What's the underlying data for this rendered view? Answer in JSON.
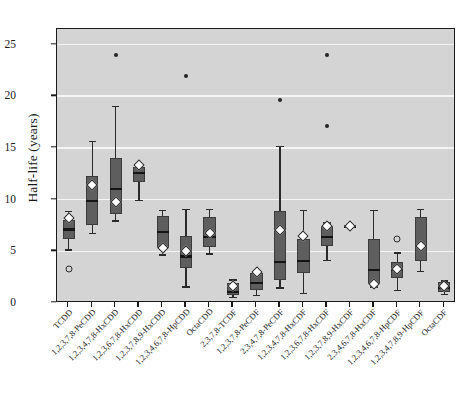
{
  "chart_data": {
    "type": "box",
    "title": "",
    "xlabel": "",
    "ylabel": "Half-life (years)",
    "ylim": [
      0,
      26.5
    ],
    "yticks": [
      0,
      5,
      10,
      15,
      20,
      25
    ],
    "grid": true,
    "legend": "none",
    "categories": [
      "TCDD",
      "1,2,3,7,8-PeCDD",
      "1,2,3,4,7,8-HxCDD",
      "1,2,3,6,7,8-HxCDD",
      "1,2,3,7,8,9-HxCDD",
      "1,2,3,4,6,7,8-HpCDD",
      "OctaCDD",
      "2,3,7,8-TCDF",
      "1,2,3,7,8-PeCDF",
      "2,3,4,7,8-PeCDF",
      "1,2,3,4,7,8-HxCDF",
      "1,2,3,6,7,8-HxCDF",
      "1,2,3,7,8,9-HxCDF",
      "2,3,4,6,7,8-HxCDF",
      "1,2,3,4,6,7,8-HpCDF",
      "1,2,3,4,7,8,9-HpCDF",
      "OctaCDF"
    ],
    "boxes": [
      {
        "category": "TCDD",
        "whisker_low": 5.2,
        "q1": 6.2,
        "median": 7.1,
        "q3": 8.0,
        "whisker_high": 8.9,
        "mean": 8.2,
        "outliers": [
          3.3
        ]
      },
      {
        "category": "1,2,3,7,8-PeCDD",
        "whisker_low": 6.8,
        "q1": 7.5,
        "median": 9.9,
        "q3": 12.3,
        "whisker_high": 15.7,
        "mean": 11.4,
        "outliers": []
      },
      {
        "category": "1,2,3,4,7,8-HxCDD",
        "whisker_low": 8.0,
        "q1": 8.6,
        "median": 11.0,
        "q3": 14.0,
        "whisker_high": 19.1,
        "mean": 9.8,
        "outliers": [
          24.0
        ]
      },
      {
        "category": "1,2,3,6,7,8-HxCDD",
        "whisker_low": 10.0,
        "q1": 11.7,
        "median": 12.6,
        "q3": 13.2,
        "whisker_high": 13.3,
        "mean": 13.3,
        "outliers": []
      },
      {
        "category": "1,2,3,7,8,9-HxCDD",
        "whisker_low": 4.7,
        "q1": 5.3,
        "median": 6.9,
        "q3": 8.4,
        "whisker_high": 9.0,
        "mean": 5.3,
        "outliers": []
      },
      {
        "category": "1,2,3,4,6,7,8-HpCDD",
        "whisker_low": 1.6,
        "q1": 3.4,
        "median": 4.5,
        "q3": 6.5,
        "whisker_high": 9.1,
        "mean": 5.0,
        "outliers": [
          22.0
        ]
      },
      {
        "category": "OctaCDD",
        "whisker_low": 4.8,
        "q1": 5.4,
        "median": 6.4,
        "q3": 8.3,
        "whisker_high": 9.1,
        "mean": 6.8,
        "outliers": []
      },
      {
        "category": "2,3,7,8-TCDF",
        "whisker_low": 0.6,
        "q1": 0.8,
        "median": 1.1,
        "q3": 1.9,
        "whisker_high": 2.3,
        "mean": 1.6,
        "outliers": []
      },
      {
        "category": "1,2,3,7,8-PeCDF",
        "whisker_low": 0.8,
        "q1": 1.3,
        "median": 1.9,
        "q3": 2.9,
        "whisker_high": 3.0,
        "mean": 3.0,
        "outliers": []
      },
      {
        "category": "2,3,4,7,8-PeCDF",
        "whisker_low": 1.5,
        "q1": 2.2,
        "median": 4.0,
        "q3": 8.9,
        "whisker_high": 15.2,
        "mean": 7.1,
        "outliers": [
          19.6
        ]
      },
      {
        "category": "1,2,3,4,7,8-HxCDF",
        "whisker_low": 1.0,
        "q1": 2.9,
        "median": 4.1,
        "q3": 6.2,
        "whisker_high": 9.0,
        "mean": 6.5,
        "outliers": []
      },
      {
        "category": "1,2,3,6,7,8-HxCDF",
        "whisker_low": 4.2,
        "q1": 5.5,
        "median": 6.4,
        "q3": 7.4,
        "whisker_high": 7.8,
        "mean": 7.4,
        "outliers": [
          24.0,
          17.1
        ]
      },
      {
        "category": "1,2,3,7,8,9-HxCDF",
        "whisker_low": 7.4,
        "q1": 7.4,
        "median": 7.4,
        "q3": 7.4,
        "whisker_high": 7.4,
        "mean": 7.4,
        "outliers": []
      },
      {
        "category": "2,3,4,6,7,8-HxCDF",
        "whisker_low": 1.6,
        "q1": 1.8,
        "median": 3.2,
        "q3": 6.2,
        "whisker_high": 9.0,
        "mean": 1.8,
        "outliers": []
      },
      {
        "category": "1,2,3,4,6,7,8-HpCDF",
        "whisker_low": 1.3,
        "q1": 2.4,
        "median": 3.2,
        "q3": 4.0,
        "whisker_high": 4.9,
        "mean": 3.3,
        "outliers": [
          6.2
        ]
      },
      {
        "category": "1,2,3,4,7,8,9-HpCDF",
        "whisker_low": 3.1,
        "q1": 4.1,
        "median": 5.5,
        "q3": 8.3,
        "whisker_high": 9.1,
        "mean": 5.5,
        "outliers": []
      },
      {
        "category": "OctaCDF",
        "whisker_low": 0.9,
        "q1": 1.1,
        "median": 1.5,
        "q3": 2.0,
        "whisker_high": 2.2,
        "mean": 1.6,
        "outliers": []
      }
    ],
    "colors": {
      "plot_background": "#d4d4d4",
      "box_fill": "#5e5e5e",
      "grid": "#f4f4f4",
      "axis": "#1a1a1a",
      "mean_marker": "#ffffff",
      "outlier": "#232323"
    }
  }
}
